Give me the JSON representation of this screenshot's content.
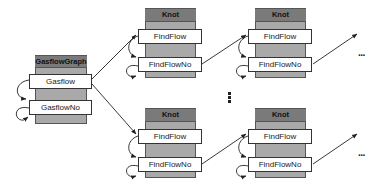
{
  "diagram": {
    "type": "object-flow-diagram",
    "nodes": [
      {
        "id": "gasflowgraph",
        "title": "GasflowGraph",
        "slots": [
          "Gasflow",
          "GasflowNo"
        ]
      },
      {
        "id": "knot-top-1",
        "title": "Knot",
        "slots": [
          "FindFlow",
          "FindFlowNo"
        ]
      },
      {
        "id": "knot-top-2",
        "title": "Knot",
        "slots": [
          "FindFlow",
          "FindFlowNo"
        ]
      },
      {
        "id": "knot-bottom-1",
        "title": "Knot",
        "slots": [
          "FindFlow",
          "FindFlowNo"
        ]
      },
      {
        "id": "knot-bottom-2",
        "title": "Knot",
        "slots": [
          "FindFlow",
          "FindFlowNo"
        ]
      }
    ],
    "edges": [
      {
        "from": "gasflowgraph.Gasflow",
        "to": "knot-top-1.FindFlow"
      },
      {
        "from": "gasflowgraph.Gasflow",
        "to": "knot-bottom-1.FindFlow"
      },
      {
        "from": "knot-top-1.FindFlowNo",
        "to": "knot-top-2.FindFlow"
      },
      {
        "from": "knot-bottom-1.FindFlowNo",
        "to": "knot-bottom-2.FindFlow"
      },
      {
        "from": "knot-top-2.FindFlowNo",
        "to": "continuation"
      },
      {
        "from": "knot-bottom-2.FindFlowNo",
        "to": "continuation"
      }
    ],
    "self_loops": [
      "each slot has a curved loop arrow on its left side"
    ],
    "continuation_horizontal": "...",
    "continuation_vertical": "⋮"
  },
  "colors": {
    "column": "#a9a9a9",
    "header": "#7a7a7a",
    "slot": "#ffffff",
    "line": "#222222"
  }
}
